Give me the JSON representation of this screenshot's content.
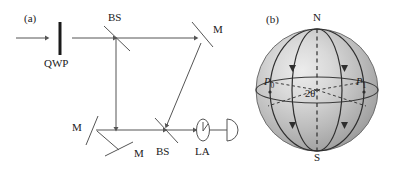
{
  "figure": {
    "panels": [
      {
        "tag": "(a)",
        "name": "interferometer-setup",
        "components": [
          {
            "id": "qwp",
            "label": "QWP",
            "type": "quarter-wave-plate"
          },
          {
            "id": "bs1",
            "label": "BS",
            "type": "beam-splitter"
          },
          {
            "id": "m_tr",
            "label": "M",
            "type": "mirror"
          },
          {
            "id": "m_bl",
            "label": "M",
            "type": "mirror"
          },
          {
            "id": "m_bb",
            "label": "M",
            "type": "mirror"
          },
          {
            "id": "bs2",
            "label": "BS",
            "type": "beam-splitter"
          },
          {
            "id": "la",
            "label": "LA",
            "type": "lens-analyzer"
          },
          {
            "id": "det",
            "label": "",
            "type": "photodetector"
          }
        ]
      },
      {
        "tag": "(b)",
        "name": "bloch-sphere",
        "poles": [
          {
            "id": "north",
            "label": "N"
          },
          {
            "id": "south",
            "label": "S"
          }
        ],
        "points": [
          {
            "id": "p0",
            "label": "P",
            "sub": "0"
          },
          {
            "id": "p1",
            "label": "P",
            "sub": "1"
          }
        ],
        "angle": {
          "id": "two-theta",
          "label": "2θ"
        }
      }
    ],
    "colors": {
      "line": "#555555",
      "ink": "#1a1a1a",
      "sphere_light": "#e8e8e8",
      "sphere_mid": "#b8b8b8",
      "sphere_dark": "#8e8e8e",
      "sphere_edge": "#6f6f6f"
    }
  }
}
